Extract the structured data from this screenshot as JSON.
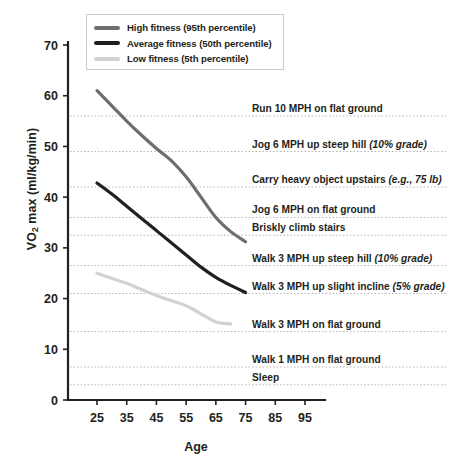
{
  "chart_data": {
    "type": "line",
    "title": "",
    "xlabel": "Age",
    "ylabel": "VO2 max (ml/kg/min)",
    "xlim": [
      20,
      100
    ],
    "ylim": [
      0,
      75
    ],
    "xticks": [
      25,
      35,
      45,
      55,
      65,
      75,
      85,
      95
    ],
    "yticks": [
      0,
      10,
      20,
      30,
      40,
      50,
      60,
      70
    ],
    "grid": "horizontal-dotted-at-annotations",
    "legend_position": "top-left-inside",
    "series": [
      {
        "name": "High fitness (95th percentile)",
        "color": "#6d6e71",
        "x": [
          25,
          30,
          35,
          40,
          45,
          50,
          55,
          60,
          65,
          70,
          75
        ],
        "values": [
          61.0,
          58.0,
          55.0,
          52.2,
          49.6,
          47.2,
          44.0,
          40.0,
          36.0,
          33.2,
          31.2
        ]
      },
      {
        "name": "Average fitness (50th percentile)",
        "color": "#231f20",
        "x": [
          25,
          30,
          35,
          40,
          45,
          50,
          55,
          60,
          65,
          70,
          75
        ],
        "values": [
          42.8,
          40.6,
          38.2,
          35.8,
          33.4,
          31.0,
          28.6,
          26.2,
          24.2,
          22.6,
          21.2
        ]
      },
      {
        "name": "Low fitness (5th percentile)",
        "color": "#d0d2d3",
        "x": [
          25,
          30,
          35,
          40,
          45,
          50,
          55,
          60,
          65,
          70
        ],
        "values": [
          25.0,
          24.0,
          23.0,
          21.8,
          20.6,
          19.6,
          18.6,
          17.0,
          15.4,
          15.0
        ]
      }
    ],
    "annotations": [
      {
        "label": "Run 10 MPH on flat ground",
        "value": 56.0,
        "italic": ""
      },
      {
        "label": "Jog 6 MPH up steep hill ",
        "value": 49.0,
        "italic": "(10% grade)"
      },
      {
        "label": "Carry heavy object upstairs ",
        "value": 42.0,
        "italic": "(e.g., 75 lb)"
      },
      {
        "label": "Jog 6 MPH on flat ground",
        "value": 36.0,
        "italic": ""
      },
      {
        "label": "Briskly climb stairs",
        "value": 32.5,
        "italic": ""
      },
      {
        "label": "Walk 3 MPH up steep hill ",
        "value": 26.5,
        "italic": "(10% grade)"
      },
      {
        "label": "Walk 3 MPH up slight incline ",
        "value": 21.0,
        "italic": "(5% grade)"
      },
      {
        "label": "Walk 3 MPH on flat ground",
        "value": 13.5,
        "italic": ""
      },
      {
        "label": "Walk 1 MPH on flat ground",
        "value": 6.5,
        "italic": ""
      },
      {
        "label": "Sleep",
        "value": 3.0,
        "italic": ""
      }
    ]
  },
  "legend": {
    "items": [
      {
        "label": "High fitness (95th percentile)",
        "color": "#6d6e71"
      },
      {
        "label": "Average fitness (50th percentile)",
        "color": "#231f20"
      },
      {
        "label": "Low fitness (5th percentile)",
        "color": "#d0d2d3"
      }
    ]
  },
  "axes": {
    "x_title": "Age",
    "y_title_main": "VO",
    "y_title_sub": "2",
    "y_title_rest": " max (ml/kg/min)"
  }
}
